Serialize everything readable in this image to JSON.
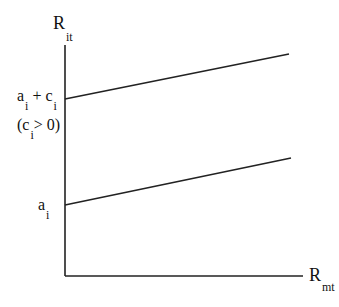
{
  "diagram": {
    "y_axis": {
      "label": "R",
      "subscript": "it"
    },
    "x_axis": {
      "label": "R",
      "subscript": "mt"
    },
    "upper_line": {
      "intercept_label": {
        "a": "a",
        "a_sub": "i",
        "plus": "+",
        "c": "c",
        "c_sub": "i"
      },
      "condition": {
        "open": "(c",
        "sub": "i",
        "rest": "> 0)"
      }
    },
    "lower_line": {
      "intercept_label": {
        "a": "a",
        "a_sub": "i"
      }
    },
    "colors": {
      "line": "#222222",
      "background": "#ffffff"
    }
  }
}
